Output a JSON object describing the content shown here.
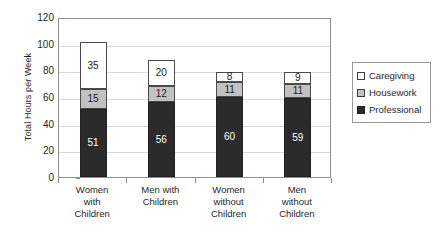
{
  "chart_data": {
    "type": "bar",
    "subtype": "stacked-vertical",
    "title": "",
    "xlabel": "",
    "ylabel": "Total Hours per Week",
    "ylim": [
      0,
      120
    ],
    "ytick_step": 20,
    "yticks": [
      120,
      100,
      80,
      60,
      40,
      20,
      0
    ],
    "grid": true,
    "grid_axis": "y",
    "legend_position": "right",
    "categories": [
      "Women with Children",
      "Men with Children",
      "Women without Children",
      "Men without Children"
    ],
    "category_lines": [
      [
        "Women",
        "with",
        "Children"
      ],
      [
        "Men with",
        "Children"
      ],
      [
        "Women",
        "without",
        "Children"
      ],
      [
        "Men",
        "without",
        "Children"
      ]
    ],
    "series": [
      {
        "name": "Professional",
        "color": "#2b2b2b",
        "values": [
          51,
          56,
          60,
          59
        ]
      },
      {
        "name": "Housework",
        "color": "#c2c2c2",
        "values": [
          15,
          12,
          11,
          11
        ]
      },
      {
        "name": "Caregiving",
        "color": "#ffffff",
        "values": [
          35,
          20,
          8,
          9
        ]
      }
    ],
    "totals": [
      101,
      88,
      79,
      79
    ],
    "legend_order": [
      "Caregiving",
      "Housework",
      "Professional"
    ]
  },
  "axis": {
    "y_title": "Total Hours per Week"
  },
  "legend": {
    "items": [
      {
        "label": "Caregiving",
        "color": "#ffffff"
      },
      {
        "label": "Housework",
        "color": "#c2c2c2"
      },
      {
        "label": "Professional",
        "color": "#2b2b2b"
      }
    ]
  }
}
